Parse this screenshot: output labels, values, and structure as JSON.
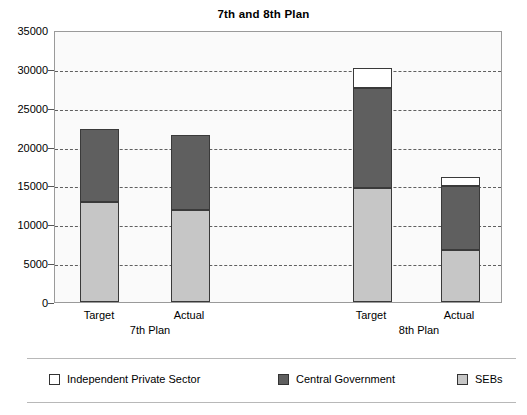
{
  "chart_data": {
    "type": "bar",
    "subtype": "stacked",
    "title": "7th and 8th Plan",
    "xlabel": "",
    "ylabel": "",
    "ylim": [
      0,
      35000
    ],
    "ytick_step": 5000,
    "yticks": [
      "0",
      "5000",
      "10000",
      "15000",
      "20000",
      "25000",
      "30000",
      "35000"
    ],
    "grid": true,
    "legend_position": "bottom",
    "groups": [
      {
        "name": "7th Plan",
        "categories": [
          "Target",
          "Actual"
        ]
      },
      {
        "name": "8th Plan",
        "categories": [
          "Target",
          "Actual"
        ]
      }
    ],
    "categories": [
      "Target",
      "Actual",
      "Target",
      "Actual"
    ],
    "series": [
      {
        "name": "SEBs",
        "color": "#C6C6C6",
        "values": [
          13000,
          11900,
          14800,
          6800
        ]
      },
      {
        "name": "Central Government",
        "color": "#5F5F5F",
        "values": [
          9400,
          9700,
          12900,
          8250
        ]
      },
      {
        "name": "Independent Private Sector",
        "color": "#FFFFFF",
        "values": [
          0,
          0,
          2700,
          1150
        ]
      }
    ],
    "totals": [
      22400,
      21600,
      30400,
      16200
    ]
  },
  "legend": {
    "items": [
      {
        "label": "Independent Private Sector",
        "color": "#FFFFFF"
      },
      {
        "label": "Central Government",
        "color": "#5F5F5F"
      },
      {
        "label": "SEBs",
        "color": "#C6C6C6"
      }
    ]
  },
  "axis": {
    "y_labels": [
      "35000",
      "30000",
      "25000",
      "20000",
      "15000",
      "10000",
      "5000",
      "0"
    ]
  },
  "x_axis": {
    "category_labels": [
      "Target",
      "Actual",
      "Target",
      "Actual"
    ],
    "group_labels": [
      "7th Plan",
      "8th Plan"
    ]
  }
}
